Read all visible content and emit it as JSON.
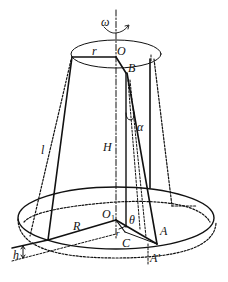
{
  "diagram": {
    "colors": {
      "stroke": "#111111",
      "background": "#ffffff"
    },
    "labels": {
      "omega": "ω",
      "O": "O",
      "r": "r",
      "B": "B",
      "alpha": "α",
      "l": "l",
      "H": "H",
      "O1": "O",
      "O1_sub": "1",
      "theta": "θ",
      "R": "R",
      "A": "A",
      "A_prime": "A′",
      "C": "C",
      "r_small": "r",
      "h": "h"
    }
  }
}
